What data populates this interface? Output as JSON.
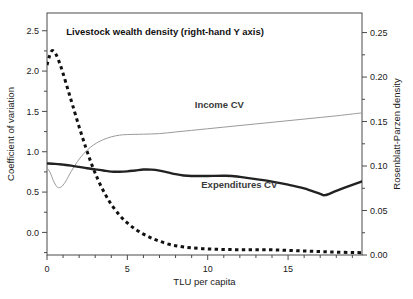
{
  "chart_data": {
    "type": "line",
    "title": "",
    "xlabel": "TLU per capita",
    "ylabel": "Coefficient of variation",
    "y2label": "Rosenblatt-Parzen density",
    "xlim": [
      0,
      19.6
    ],
    "ylim": [
      -0.28,
      2.72
    ],
    "y2lim": [
      0,
      0.272
    ],
    "grid": false,
    "legend_position": "inline-annotations",
    "xticks": [
      0,
      5,
      10,
      15
    ],
    "xtick_labels": [
      "0",
      "5",
      "10",
      "15"
    ],
    "yticks": [
      0.0,
      0.5,
      1.0,
      1.5,
      2.0,
      2.5
    ],
    "ytick_labels": [
      "0.0",
      "0.5",
      "1.0",
      "1.5",
      "2.0",
      "2.5"
    ],
    "y2ticks": [
      0.0,
      0.05,
      0.1,
      0.15,
      0.2,
      0.25
    ],
    "y2tick_labels": [
      "0.00",
      "0.05",
      "0.10",
      "0.15",
      "0.20",
      "0.25"
    ],
    "annotations": [
      {
        "name": "livestock-wealth-density-label",
        "text": "Livestock wealth density (right-hand Y axis)",
        "x": 1.2,
        "y": 2.45,
        "style": "bold-dark"
      },
      {
        "name": "income-cv-label",
        "text": "Income CV",
        "x": 9.2,
        "y": 1.54,
        "style": "bold-gray"
      },
      {
        "name": "expenditures-cv-label",
        "text": "Expenditures CV",
        "x": 9.6,
        "y": 0.55,
        "style": "bold-gray"
      }
    ],
    "series": [
      {
        "name": "Livestock wealth density",
        "axis": "right",
        "style": "dashed",
        "color": "#111111",
        "width": 3.0,
        "x": [
          0.0,
          0.15,
          0.3,
          0.45,
          0.6,
          0.8,
          1.0,
          1.3,
          1.6,
          2.0,
          2.4,
          2.8,
          3.2,
          3.6,
          4.0,
          4.5,
          5.0,
          5.5,
          6.0,
          6.5,
          7.0,
          7.6,
          8.2,
          9.0,
          10.0,
          11.0,
          12.0,
          13.0,
          14.0,
          15.0,
          16.0,
          17.0,
          18.0,
          19.0,
          19.6
        ],
        "y_right": [
          0.2135,
          0.2235,
          0.2295,
          0.2285,
          0.224,
          0.215,
          0.204,
          0.186,
          0.168,
          0.144,
          0.1215,
          0.101,
          0.0835,
          0.069,
          0.057,
          0.045,
          0.036,
          0.029,
          0.0235,
          0.019,
          0.0155,
          0.012,
          0.0098,
          0.008,
          0.0068,
          0.0062,
          0.006,
          0.006,
          0.0058,
          0.0052,
          0.0045,
          0.0038,
          0.0032,
          0.0028,
          0.0026
        ],
        "y_left_equiv": [
          2.31,
          2.42,
          2.48,
          2.47,
          2.42,
          2.33,
          2.21,
          2.01,
          1.81,
          1.55,
          1.31,
          1.09,
          0.9,
          0.745,
          0.615,
          0.485,
          0.389,
          0.313,
          0.254,
          0.205,
          0.168,
          0.13,
          0.106,
          0.086,
          0.074,
          0.067,
          0.065,
          0.065,
          0.063,
          0.056,
          0.049,
          0.041,
          0.035,
          0.03,
          0.028
        ]
      },
      {
        "name": "Income CV",
        "axis": "left",
        "style": "solid-thin",
        "color": "#9a9a9a",
        "width": 1.0,
        "x": [
          0.0,
          0.2,
          0.4,
          0.6,
          0.75,
          0.95,
          1.2,
          1.5,
          1.9,
          2.3,
          2.7,
          3.1,
          3.5,
          4.0,
          4.5,
          5.0,
          6.0,
          7.0,
          8.0,
          9.0,
          10.0,
          11.0,
          12.0,
          13.0,
          14.0,
          15.0,
          16.0,
          17.0,
          18.0,
          19.0,
          19.6
        ],
        "y": [
          0.8,
          0.74,
          0.64,
          0.57,
          0.555,
          0.575,
          0.645,
          0.755,
          0.88,
          0.98,
          1.055,
          1.11,
          1.15,
          1.185,
          1.205,
          1.213,
          1.218,
          1.225,
          1.245,
          1.265,
          1.285,
          1.305,
          1.325,
          1.345,
          1.365,
          1.385,
          1.405,
          1.425,
          1.445,
          1.468,
          1.482
        ]
      },
      {
        "name": "Expenditures CV",
        "axis": "left",
        "style": "solid-thick",
        "color": "#222222",
        "width": 2.4,
        "x": [
          0.0,
          0.5,
          1.0,
          1.5,
          2.0,
          2.5,
          3.0,
          3.5,
          4.0,
          4.5,
          5.0,
          5.5,
          6.0,
          6.5,
          7.0,
          7.5,
          8.0,
          8.5,
          9.0,
          10.0,
          11.0,
          11.5,
          12.0,
          13.0,
          14.0,
          15.0,
          16.0,
          17.0,
          17.3,
          18.0,
          19.0,
          19.6
        ],
        "y": [
          0.855,
          0.85,
          0.84,
          0.828,
          0.812,
          0.795,
          0.782,
          0.768,
          0.754,
          0.752,
          0.757,
          0.768,
          0.779,
          0.778,
          0.766,
          0.745,
          0.722,
          0.706,
          0.7,
          0.7,
          0.702,
          0.7,
          0.688,
          0.66,
          0.63,
          0.592,
          0.545,
          0.478,
          0.462,
          0.515,
          0.59,
          0.632
        ]
      }
    ]
  },
  "axes_geometry": {
    "left_px": 47,
    "right_px": 362,
    "top_px": 13,
    "bottom_px": 255
  }
}
